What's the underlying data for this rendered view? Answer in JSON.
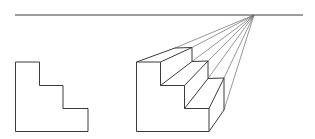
{
  "diagram": {
    "horizon_line": {
      "x1": 15,
      "y1": 15,
      "x2": 303,
      "y2": 15
    },
    "vanishing_point": {
      "x": 254,
      "y": 15
    },
    "front_view_profile": {
      "points": "15.5,62 39.5,62 39.5,85.5 63,85.5 63,108.5 88,108.5 88,131.5 15.5,131.5"
    },
    "perspective_staircase": {
      "front_face": "136.5,62 160.5,62 160.5,85.5 184.5,85.5 184.5,108.5 209,108.5 209,131.5 136.5,131.5",
      "back_profile": "175,48 192,47.5 192,61.5 208,61 208,78.5 224,78 224,110",
      "receding_edges": [
        {
          "x1": 136.5,
          "y1": 62,
          "x2": 175,
          "y2": 48
        },
        {
          "x1": 160.5,
          "y1": 62,
          "x2": 192,
          "y2": 47.5
        },
        {
          "x1": 160.5,
          "y1": 85.5,
          "x2": 192,
          "y2": 61.5
        },
        {
          "x1": 184.5,
          "y1": 85.5,
          "x2": 208,
          "y2": 61
        },
        {
          "x1": 184.5,
          "y1": 108.5,
          "x2": 208,
          "y2": 78.5
        },
        {
          "x1": 209,
          "y1": 108.5,
          "x2": 224,
          "y2": 78
        },
        {
          "x1": 209,
          "y1": 131.5,
          "x2": 224,
          "y2": 110
        }
      ],
      "construction_lines_to_vp": [
        {
          "x1": 175,
          "y1": 48
        },
        {
          "x1": 192,
          "y1": 47.5
        },
        {
          "x1": 192,
          "y1": 61.5
        },
        {
          "x1": 208,
          "y1": 61
        },
        {
          "x1": 208,
          "y1": 78.5
        },
        {
          "x1": 224,
          "y1": 78
        },
        {
          "x1": 224,
          "y1": 110
        }
      ]
    }
  }
}
